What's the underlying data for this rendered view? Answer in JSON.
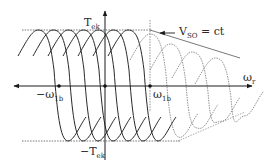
{
  "diagram": {
    "colors": {
      "ink": "#2a2a2a",
      "dotted": "#6a6a6a",
      "background": "#ffffff"
    },
    "axes": {
      "x_label": "ω",
      "x_label_sub": "r",
      "y_label_top": "T",
      "y_label_top_sub": "ek",
      "y_label_bottom": "−T",
      "y_label_bottom_sub": "ek"
    },
    "markers": {
      "neg_base_speed": {
        "text": "−ω",
        "sub": "1b"
      },
      "pos_base_speed": {
        "text": "ω",
        "sub": "1b"
      }
    },
    "annotation": {
      "text": "V",
      "sub": "SO",
      "suffix": " = ct"
    },
    "curves": {
      "solid_peaks_x": [
        38,
        53,
        68,
        83,
        98,
        113,
        128
      ],
      "dotted_peaks": [
        [
          150,
          34
        ],
        [
          170,
          44
        ],
        [
          192,
          52
        ],
        [
          215,
          58
        ]
      ]
    }
  }
}
